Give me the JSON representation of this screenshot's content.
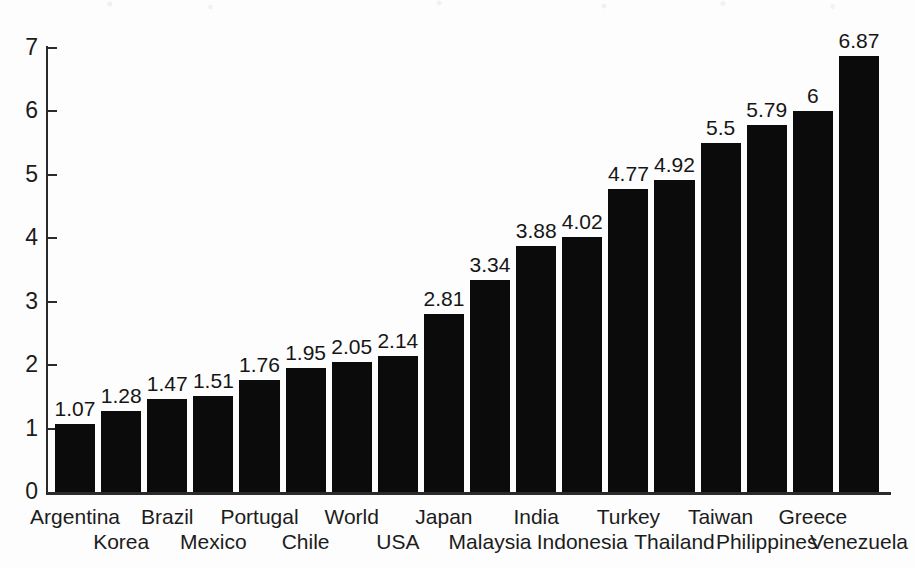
{
  "chart_data": {
    "type": "bar",
    "title": "",
    "subtitle": "",
    "xlabel": "",
    "ylabel": "",
    "categories": [
      "Argentina",
      "Korea",
      "Brazil",
      "Mexico",
      "Portugal",
      "Chile",
      "World",
      "USA",
      "Japan",
      "Malaysia",
      "India",
      "Indonesia",
      "Turkey",
      "Thailand",
      "Taiwan",
      "Philippines",
      "Greece",
      "Venezuela"
    ],
    "values": [
      1.07,
      1.28,
      1.47,
      1.51,
      1.76,
      1.95,
      2.05,
      2.14,
      2.81,
      3.34,
      3.88,
      4.02,
      4.77,
      4.92,
      5.5,
      5.79,
      6,
      6.87
    ],
    "value_labels": [
      "1.07",
      "1.28",
      "1.47",
      "1.51",
      "1.76",
      "1.95",
      "2.05",
      "2.14",
      "2.81",
      "3.34",
      "3.88",
      "4.02",
      "4.77",
      "4.92",
      "5.5",
      "5.79",
      "6",
      "6.87"
    ],
    "ylim": [
      0,
      7
    ],
    "ytick_labels": [
      "0",
      "1",
      "2",
      "3",
      "4",
      "5",
      "6",
      "7"
    ],
    "ytick_values": [
      0,
      1,
      2,
      3,
      4,
      5,
      6,
      7
    ],
    "grid": false,
    "legend": null,
    "bar_color": "#0b0b0b",
    "axis_color": "#2b2b2b",
    "background_color": "#fdfdfd",
    "sorted": "ascending",
    "n_bars": 18,
    "label_layout": "alternating-two-rows",
    "annotations": [
      "data labels above every bar"
    ]
  }
}
